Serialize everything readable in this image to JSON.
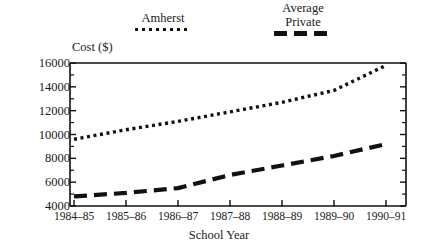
{
  "chart_data": {
    "type": "line",
    "title": "",
    "xlabel": "School Year",
    "ylabel": "Cost ($)",
    "categories": [
      "1984–85",
      "1985–86",
      "1986–87",
      "1987–88",
      "1988–89",
      "1989–90",
      "1990–91"
    ],
    "ylim": [
      4000,
      16000
    ],
    "ytick_values": [
      4000,
      6000,
      8000,
      10000,
      12000,
      14000,
      16000
    ],
    "ytick_labels": [
      "4000",
      "6000",
      "8000",
      "10000",
      "12000",
      "14000",
      "16000"
    ],
    "yminor_step": 1000,
    "grid": false,
    "legend_position": "above-plot",
    "series": [
      {
        "name": "Amherst",
        "style": "dotted",
        "color": "#111111",
        "values": [
          9600,
          10400,
          11100,
          11900,
          12700,
          13700,
          15800
        ]
      },
      {
        "name": "Average\nPrivate",
        "style": "dashed",
        "color": "#111111",
        "values": [
          4800,
          5100,
          5500,
          6600,
          7400,
          8200,
          9200
        ]
      }
    ]
  },
  "legend": {
    "entries": [
      {
        "label": "Amherst",
        "marker": "dotted-line-swatch"
      },
      {
        "label": "Average\nPrivate",
        "marker": "dashed-line-swatch"
      }
    ]
  }
}
